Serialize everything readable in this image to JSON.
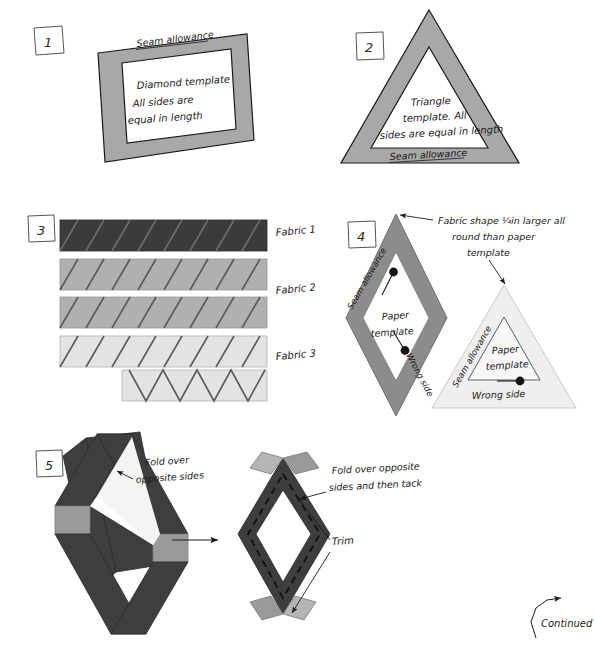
{
  "page": {
    "width": 595,
    "height": 656,
    "background": "#ffffff",
    "continued_label": "Continued"
  },
  "colors": {
    "seam_allowance_grey": "#a8a8a8",
    "fabric1_dark": "#3b3b3b",
    "fabric2_mid": "#b0b0b0",
    "fabric3_light": "#e3e3e3",
    "outline": "#1a1a1a",
    "fold_light": "#9a9a9a",
    "fold_dark": "#4a4a4a",
    "pin_head": "#141414",
    "ink": "#1a1a1a"
  },
  "steps": [
    {
      "number": "1",
      "name": "diamond-template",
      "labels": [
        {
          "name": "seam-allowance-label",
          "text": "Seam allowance"
        },
        {
          "name": "template-line-1",
          "text": "Diamond template"
        },
        {
          "name": "template-line-2",
          "text": "All sides are"
        },
        {
          "name": "template-line-3",
          "text": "equal in length"
        }
      ]
    },
    {
      "number": "2",
      "name": "triangle-template",
      "labels": [
        {
          "name": "template-line-1",
          "text": "Triangle"
        },
        {
          "name": "template-line-2",
          "text": "template. All"
        },
        {
          "name": "template-line-3",
          "text": "sides are equal in length"
        },
        {
          "name": "seam-allowance-label",
          "text": "Seam allowance"
        }
      ]
    },
    {
      "number": "3",
      "name": "fabric-strips",
      "labels": [
        {
          "name": "fabric-1-label",
          "text": "Fabric 1"
        },
        {
          "name": "fabric-2-label",
          "text": "Fabric 2"
        },
        {
          "name": "fabric-3-label",
          "text": "Fabric 3"
        }
      ],
      "strips": [
        {
          "name": "strip-fabric-1",
          "fill": "#3b3b3b",
          "cuts": "diagonal"
        },
        {
          "name": "strip-fabric-2a",
          "fill": "#b0b0b0",
          "cuts": "diagonal"
        },
        {
          "name": "strip-fabric-2b",
          "fill": "#b0b0b0",
          "cuts": "diagonal"
        },
        {
          "name": "strip-fabric-3a",
          "fill": "#e3e3e3",
          "cuts": "diagonal"
        },
        {
          "name": "strip-fabric-3b",
          "fill": "#e3e3e3",
          "cuts": "zigzag"
        }
      ]
    },
    {
      "number": "4",
      "name": "fabric-over-paper-template",
      "labels": [
        {
          "name": "callout-line-1",
          "text": "Fabric shape ¼in larger all"
        },
        {
          "name": "callout-line-2",
          "text": "round than paper"
        },
        {
          "name": "callout-line-3",
          "text": "template"
        },
        {
          "name": "diamond-seam-allowance",
          "text": "Seam allowance"
        },
        {
          "name": "diamond-paper-template-1",
          "text": "Paper"
        },
        {
          "name": "diamond-paper-template-2",
          "text": "template"
        },
        {
          "name": "diamond-wrong-side",
          "text": "Wrong side"
        },
        {
          "name": "triangle-seam-allowance",
          "text": "Seam allowance"
        },
        {
          "name": "triangle-paper-template-1",
          "text": "Paper"
        },
        {
          "name": "triangle-paper-template-2",
          "text": "template"
        },
        {
          "name": "triangle-wrong-side",
          "text": "Wrong side"
        }
      ]
    },
    {
      "number": "5",
      "name": "fold-and-tack",
      "labels": [
        {
          "name": "fold-callout-left-1",
          "text": "Fold over"
        },
        {
          "name": "fold-callout-left-2",
          "text": "opposite sides"
        },
        {
          "name": "fold-callout-right-1",
          "text": "Fold over opposite"
        },
        {
          "name": "fold-callout-right-2",
          "text": "sides and then tack"
        },
        {
          "name": "trim-label",
          "text": "Trim"
        }
      ]
    }
  ]
}
